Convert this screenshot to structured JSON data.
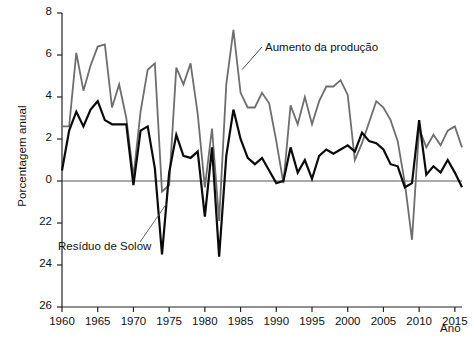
{
  "chart_data": {
    "type": "line",
    "title": "",
    "xlabel": "Ano",
    "ylabel": "Porcentagem anual",
    "xlim": [
      1960,
      2016
    ],
    "ylim": [
      -6,
      8
    ],
    "grid": false,
    "legend_position": "inline-annotations",
    "xticks": [
      1960,
      1965,
      1970,
      1975,
      1980,
      1985,
      1990,
      1995,
      2000,
      2005,
      2010,
      2015
    ],
    "xtick_labels": [
      "1960",
      "1965",
      "1970",
      "1975",
      "1980",
      "1985",
      "1990",
      "1995",
      "2000",
      "2005",
      "2010",
      "2015"
    ],
    "yticks": [
      8,
      6,
      4,
      2,
      0,
      -2,
      -4,
      -6
    ],
    "ytick_labels": [
      "8",
      "6",
      "4",
      "2",
      "0",
      "22",
      "24",
      "26"
    ],
    "annotations": [
      {
        "name": "producao-annotation",
        "text": "Aumento da produção",
        "points_to_year": 1986,
        "points_to_value": 5.4
      },
      {
        "name": "solow-annotation",
        "text": "Resíduo de Solow",
        "points_to_year": 1975,
        "points_to_value": -1.0
      }
    ],
    "x": [
      1960,
      1961,
      1962,
      1963,
      1964,
      1965,
      1966,
      1967,
      1968,
      1969,
      1970,
      1971,
      1972,
      1973,
      1974,
      1975,
      1976,
      1977,
      1978,
      1979,
      1980,
      1981,
      1982,
      1983,
      1984,
      1985,
      1986,
      1987,
      1988,
      1989,
      1990,
      1991,
      1992,
      1993,
      1994,
      1995,
      1996,
      1997,
      1998,
      1999,
      2000,
      2001,
      2002,
      2003,
      2004,
      2005,
      2006,
      2007,
      2008,
      2009,
      2010,
      2011,
      2012,
      2013,
      2014,
      2015,
      2016
    ],
    "series": [
      {
        "name": "Aumento da produção",
        "color": "#6e6e6e",
        "linewidth": 1.8,
        "values": [
          2.6,
          2.6,
          6.1,
          4.3,
          5.5,
          6.4,
          6.5,
          3.5,
          4.6,
          3.0,
          0.2,
          3.3,
          5.3,
          5.6,
          -0.5,
          -0.2,
          5.4,
          4.6,
          5.6,
          3.2,
          -0.3,
          2.5,
          -1.9,
          4.6,
          7.2,
          4.2,
          3.5,
          3.5,
          4.2,
          3.7,
          1.9,
          -0.1,
          3.6,
          2.7,
          4.0,
          2.7,
          3.8,
          4.5,
          4.5,
          4.8,
          4.1,
          1.0,
          1.8,
          2.8,
          3.8,
          3.5,
          2.9,
          1.9,
          -0.1,
          -2.8,
          2.5,
          1.6,
          2.2,
          1.7,
          2.4,
          2.6,
          1.6
        ]
      },
      {
        "name": "Resíduo de Solow",
        "color": "#0b0b0b",
        "linewidth": 2.2,
        "values": [
          0.5,
          2.4,
          3.3,
          2.6,
          3.4,
          3.8,
          2.9,
          2.7,
          2.7,
          2.7,
          -0.2,
          2.4,
          2.6,
          0.6,
          -3.5,
          0.4,
          2.2,
          1.2,
          1.1,
          1.4,
          -1.7,
          1.6,
          -3.6,
          1.2,
          3.4,
          2.0,
          1.1,
          0.8,
          1.1,
          0.5,
          -0.1,
          0.0,
          1.6,
          0.4,
          1.0,
          0.1,
          1.2,
          1.5,
          1.3,
          1.5,
          1.7,
          1.4,
          2.3,
          1.9,
          1.8,
          1.5,
          0.8,
          0.7,
          -0.3,
          -0.1,
          2.9,
          0.3,
          0.7,
          0.4,
          1.0,
          0.4,
          -0.3
        ]
      }
    ]
  },
  "axes": {
    "ylabel": "Porcentagem anual",
    "xlabel": "Ano"
  }
}
